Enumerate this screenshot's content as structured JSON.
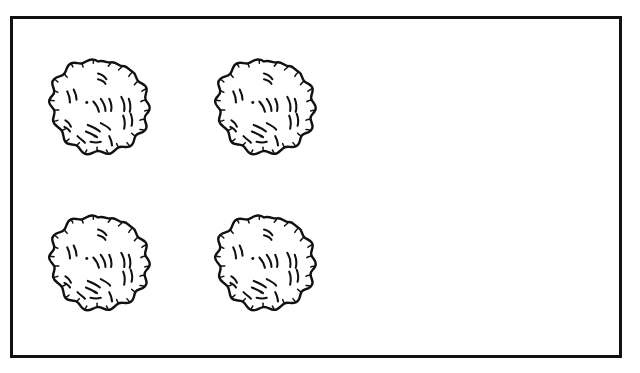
{
  "page": {
    "background_color": "#ffffff",
    "ink_color": "#111111",
    "width": 640,
    "height": 373
  },
  "frame": {
    "name": "outer rectangle border",
    "shape": "rectangle",
    "stroke_color": "#111111",
    "fill_color": "#ffffff",
    "stroke_width": 3,
    "x": 10,
    "y": 16,
    "width": 612,
    "height": 342
  },
  "layout": {
    "arrangement": "2 columns x 2 rows",
    "columns": 2,
    "rows": 2,
    "total_objects": 4,
    "occupied_region": "left half of frame",
    "empty_region": "right half of frame"
  },
  "objects": [
    {
      "id": "object-1",
      "label": "fluffy round object",
      "row": 1,
      "column": 1,
      "center_x": 98,
      "center_y": 110,
      "diameter": 112,
      "style": "black outline line art, scalloped fluffy edge, short curved hatch marks inside",
      "fill_color": "#ffffff",
      "outline_color": "#111111"
    },
    {
      "id": "object-2",
      "label": "fluffy round object",
      "row": 1,
      "column": 2,
      "center_x": 264,
      "center_y": 110,
      "diameter": 112,
      "style": "black outline line art, scalloped fluffy edge, short curved hatch marks inside",
      "fill_color": "#ffffff",
      "outline_color": "#111111"
    },
    {
      "id": "object-3",
      "label": "fluffy round object",
      "row": 2,
      "column": 1,
      "center_x": 98,
      "center_y": 266,
      "diameter": 112,
      "style": "black outline line art, scalloped fluffy edge, short curved hatch marks inside",
      "fill_color": "#ffffff",
      "outline_color": "#111111"
    },
    {
      "id": "object-4",
      "label": "fluffy round object",
      "row": 2,
      "column": 2,
      "center_x": 264,
      "center_y": 266,
      "diameter": 112,
      "style": "black outline line art, scalloped fluffy edge, short curved hatch marks inside",
      "fill_color": "#ffffff",
      "outline_color": "#111111"
    }
  ]
}
